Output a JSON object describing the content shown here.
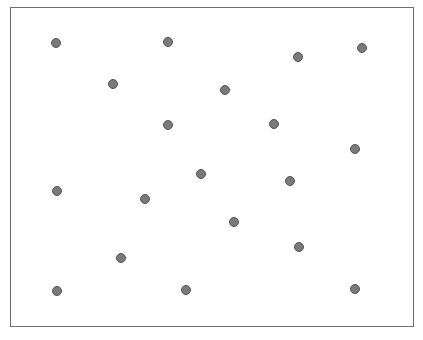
{
  "canvas": {
    "width": 423,
    "height": 340,
    "background": "#ffffff"
  },
  "frame": {
    "left": 10,
    "top": 7,
    "right": 414,
    "bottom": 327,
    "border_color": "#6e6e6e"
  },
  "dot_style": {
    "fill": "#7a7a7a",
    "stroke": "#555555",
    "diameter": 10
  },
  "dots": [
    {
      "x": 56,
      "y": 43
    },
    {
      "x": 168,
      "y": 42
    },
    {
      "x": 298,
      "y": 57
    },
    {
      "x": 362,
      "y": 48
    },
    {
      "x": 113,
      "y": 84
    },
    {
      "x": 225,
      "y": 90
    },
    {
      "x": 168,
      "y": 125
    },
    {
      "x": 274,
      "y": 124
    },
    {
      "x": 355,
      "y": 149
    },
    {
      "x": 201,
      "y": 174
    },
    {
      "x": 290,
      "y": 181
    },
    {
      "x": 57,
      "y": 191
    },
    {
      "x": 145,
      "y": 199
    },
    {
      "x": 234,
      "y": 222
    },
    {
      "x": 299,
      "y": 247
    },
    {
      "x": 121,
      "y": 258
    },
    {
      "x": 57,
      "y": 291
    },
    {
      "x": 186,
      "y": 290
    },
    {
      "x": 355,
      "y": 289
    }
  ]
}
